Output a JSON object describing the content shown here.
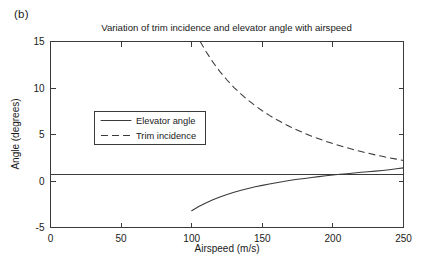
{
  "panel": {
    "label": "(b)"
  },
  "chart_data": {
    "type": "line",
    "title": "Variation of trim incidence and elevator angle with airspeed",
    "xlabel": "Airspeed (m/s)",
    "ylabel": "Angle (degrees)",
    "xlim": [
      0,
      250
    ],
    "ylim": [
      -5,
      15
    ],
    "xticks": [
      0,
      50,
      100,
      150,
      200,
      250
    ],
    "yticks": [
      -5,
      0,
      5,
      10,
      15
    ],
    "xticklabels": [
      "0",
      "50",
      "100",
      "150",
      "200",
      "250"
    ],
    "yticklabels": [
      "-5",
      "0",
      "5",
      "10",
      "15"
    ],
    "grid": false,
    "legend_position": "center-left",
    "zero_reference_line": 0,
    "line_color": "#3a3a3a",
    "background": "#ffffff",
    "series": [
      {
        "name": "Elevator angle",
        "style": "solid",
        "x": [
          100,
          105,
          110,
          115,
          120,
          125,
          130,
          135,
          140,
          145,
          150,
          155,
          160,
          165,
          170,
          175,
          180,
          185,
          190,
          195,
          200,
          205,
          210,
          215,
          220,
          225,
          230,
          235,
          240,
          245,
          250
        ],
        "values": [
          -3.2,
          -2.75,
          -2.36,
          -2.02,
          -1.72,
          -1.45,
          -1.21,
          -1.0,
          -0.81,
          -0.63,
          -0.47,
          -0.32,
          -0.18,
          -0.05,
          0.07,
          0.18,
          0.28,
          0.38,
          0.47,
          0.56,
          0.64,
          0.72,
          0.79,
          0.86,
          0.93,
          0.99,
          1.06,
          1.14,
          1.22,
          1.31,
          1.41
        ]
      },
      {
        "name": "Trim incidence",
        "style": "dashed",
        "x": [
          106,
          110,
          115,
          120,
          125,
          130,
          135,
          140,
          145,
          150,
          155,
          160,
          165,
          170,
          175,
          180,
          185,
          190,
          195,
          200,
          205,
          210,
          215,
          220,
          225,
          230,
          235,
          240,
          245,
          250
        ],
        "values": [
          15.0,
          13.95,
          12.78,
          11.76,
          10.86,
          10.05,
          9.33,
          8.68,
          8.09,
          7.55,
          7.06,
          6.61,
          6.2,
          5.81,
          5.46,
          5.13,
          4.82,
          4.54,
          4.27,
          4.02,
          3.79,
          3.57,
          3.36,
          3.17,
          2.98,
          2.81,
          2.65,
          2.49,
          2.35,
          2.21
        ]
      }
    ],
    "annotations": [
      {
        "text": "curves intersect near 228 m/s",
        "x": 228,
        "y": 1.0
      }
    ]
  },
  "legend": {
    "entries": [
      {
        "label": "Elevator angle",
        "style": "solid"
      },
      {
        "label": "Trim incidence",
        "style": "dashed"
      }
    ]
  }
}
